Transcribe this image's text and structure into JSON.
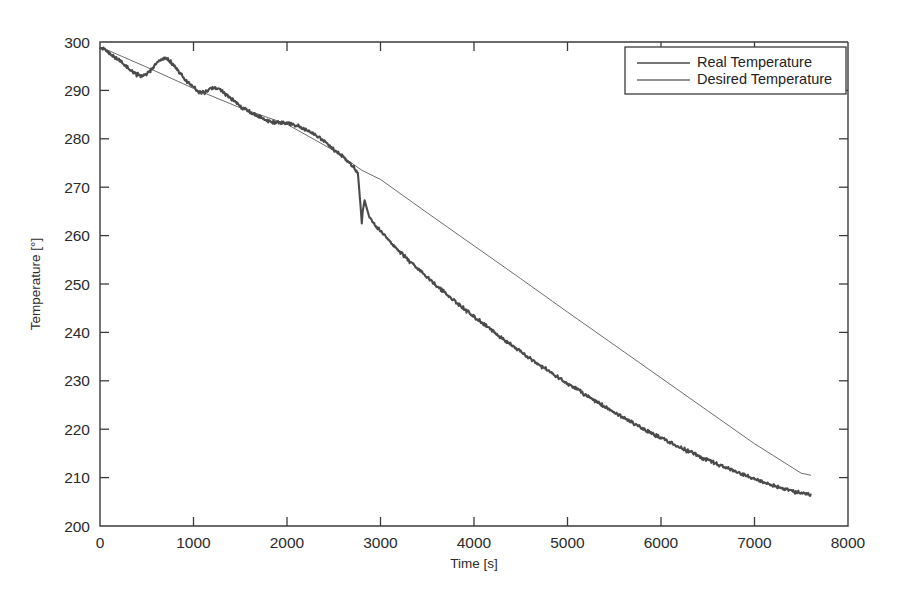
{
  "chart_data": {
    "type": "line",
    "title": "",
    "xlabel": "Time [s]",
    "ylabel": "Temperature [°]",
    "xlim": [
      0,
      8000
    ],
    "ylim": [
      200,
      300
    ],
    "xticks": [
      0,
      1000,
      2000,
      3000,
      4000,
      5000,
      6000,
      7000,
      8000
    ],
    "yticks": [
      200,
      210,
      220,
      230,
      240,
      250,
      260,
      270,
      280,
      290,
      300
    ],
    "xticklabels": [
      "0",
      "1000",
      "2000",
      "3000",
      "4000",
      "5000",
      "6000",
      "7000",
      "8000"
    ],
    "yticklabels": [
      "200",
      "210",
      "220",
      "230",
      "240",
      "250",
      "260",
      "270",
      "280",
      "290",
      "300"
    ],
    "grid": false,
    "legend_position": "upper right",
    "colors": {
      "real": "#4a4a4a",
      "desired": "#6e6e6e",
      "axis": "#3b3b3b",
      "background": "#ffffff"
    },
    "series": [
      {
        "name": "Real Temperature",
        "style": "noisy-thick",
        "x": [
          0,
          100,
          200,
          300,
          380,
          450,
          520,
          600,
          660,
          720,
          780,
          850,
          920,
          1000,
          1060,
          1120,
          1180,
          1250,
          1320,
          1400,
          1500,
          1600,
          1700,
          1800,
          1900,
          2000,
          2100,
          2200,
          2300,
          2400,
          2500,
          2600,
          2700,
          2760,
          2800,
          2810,
          2830,
          2860,
          2900,
          3000,
          3100,
          3200,
          3300,
          3400,
          3500,
          3600,
          3700,
          3800,
          3900,
          4000,
          4100,
          4200,
          4300,
          4400,
          4500,
          4600,
          4700,
          4800,
          4900,
          5000,
          5100,
          5200,
          5300,
          5400,
          5500,
          5600,
          5700,
          5800,
          5900,
          6000,
          6100,
          6200,
          6300,
          6400,
          6500,
          6600,
          6700,
          6800,
          6900,
          7000,
          7100,
          7200,
          7300,
          7400,
          7500,
          7600
        ],
        "y": [
          299.0,
          297.6,
          296.3,
          294.6,
          293.4,
          292.9,
          293.7,
          295.4,
          296.5,
          296.6,
          295.4,
          293.7,
          292.1,
          290.6,
          289.6,
          289.6,
          290.4,
          290.5,
          289.6,
          288.3,
          286.7,
          285.5,
          284.6,
          283.6,
          283.3,
          283.3,
          282.9,
          282.0,
          280.8,
          279.4,
          277.8,
          276.2,
          274.4,
          272.8,
          262.5,
          265.0,
          267.3,
          265.2,
          263.2,
          261.0,
          258.8,
          256.8,
          254.9,
          253.1,
          251.4,
          249.7,
          248.0,
          246.4,
          244.8,
          243.3,
          241.8,
          240.3,
          238.8,
          237.4,
          236.0,
          234.6,
          233.3,
          232.0,
          230.7,
          229.4,
          228.2,
          227.0,
          225.8,
          224.6,
          223.5,
          222.4,
          221.3,
          220.2,
          219.2,
          218.2,
          217.2,
          216.3,
          215.4,
          214.5,
          213.6,
          212.8,
          212.0,
          211.2,
          210.4,
          209.7,
          209.0,
          208.4,
          207.8,
          207.2,
          206.8,
          206.5
        ]
      },
      {
        "name": "Desired Temperature",
        "style": "smooth-thin",
        "x": [
          0,
          500,
          1000,
          1500,
          2000,
          2500,
          2800,
          3000,
          3500,
          4000,
          4500,
          5000,
          5500,
          6000,
          6500,
          7000,
          7500,
          7600
        ],
        "y": [
          299.0,
          294.8,
          290.4,
          286.4,
          283.0,
          277.6,
          273.5,
          271.6,
          264.7,
          257.9,
          251.1,
          244.2,
          237.4,
          230.6,
          223.8,
          217.0,
          210.9,
          210.5
        ]
      }
    ]
  },
  "legend": {
    "items": [
      {
        "label": "Real Temperature"
      },
      {
        "label": "Desired Temperature"
      }
    ]
  }
}
